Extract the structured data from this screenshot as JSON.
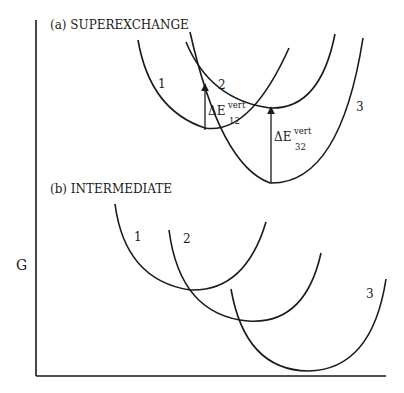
{
  "axes": {
    "y_label": "G"
  },
  "panels": [
    {
      "id": "a",
      "title": "(a) SUPEREXCHANGE",
      "curves": [
        {
          "label": "1"
        },
        {
          "label": "2"
        },
        {
          "label": "3"
        }
      ],
      "transitions": [
        {
          "symbol": "ΔE",
          "superscript": "vert",
          "subscript": "12"
        },
        {
          "symbol": "ΔE",
          "superscript": "vert",
          "subscript": "32"
        }
      ]
    },
    {
      "id": "b",
      "title": "(b) INTERMEDIATE",
      "curves": [
        {
          "label": "1"
        },
        {
          "label": "2"
        },
        {
          "label": "3"
        }
      ]
    }
  ]
}
